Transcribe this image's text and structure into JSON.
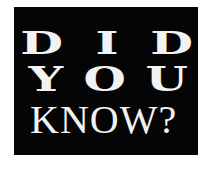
{
  "graphic": {
    "lines": [
      {
        "text": "DID",
        "letters": [
          "D",
          "I",
          "D"
        ]
      },
      {
        "text": "YOU",
        "letters": [
          "Y",
          "O",
          "U"
        ]
      },
      {
        "text": "KNOW?"
      }
    ]
  },
  "colors": {
    "page_background": "#ffffff",
    "box_background": "#050505",
    "text": "#f2f2f2"
  }
}
